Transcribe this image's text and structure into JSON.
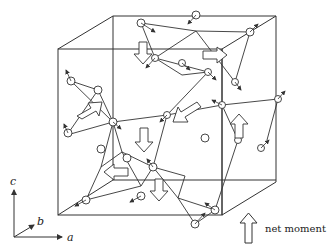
{
  "diagram": {
    "type": "magnetic structure",
    "axes": {
      "c": "c",
      "b": "b",
      "a": "a"
    },
    "legend": {
      "label": "net moment"
    }
  }
}
